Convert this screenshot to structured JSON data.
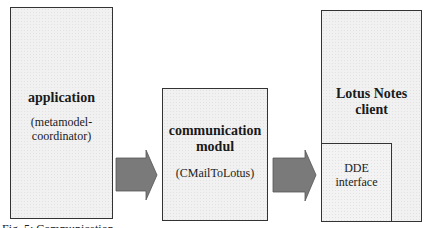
{
  "diagram": {
    "nodes": [
      {
        "id": "application",
        "title": "application",
        "subtitle_lines": [
          "(metamodel-",
          "coordinator)"
        ]
      },
      {
        "id": "communication",
        "title_lines": [
          "communication",
          "modul"
        ],
        "subtitle": "(CMailToLotus)"
      },
      {
        "id": "lotus",
        "title_lines": [
          "Lotus Notes",
          "client"
        ]
      },
      {
        "id": "dde",
        "lines": [
          "DDE",
          "interface"
        ],
        "parent": "lotus"
      }
    ],
    "edges": [
      {
        "from": "application",
        "to": "communication",
        "style": "block-arrow"
      },
      {
        "from": "communication",
        "to": "dde",
        "style": "block-arrow"
      }
    ],
    "colors": {
      "box_fill": "#f1f1f1",
      "box_border": "#333333",
      "arrow_fill": "#7a7a7a"
    }
  },
  "caption": "Fig. 5: Communication ..."
}
